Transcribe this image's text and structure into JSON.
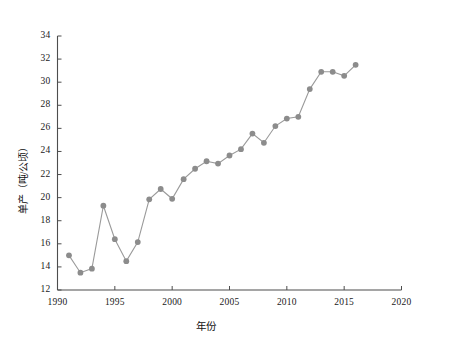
{
  "chart_data": {
    "type": "line",
    "title": "",
    "subtitle": "",
    "xlabel": "年份",
    "ylabel": "单产（吨/公顷）",
    "xlim": [
      1990,
      2020
    ],
    "ylim": [
      12,
      34
    ],
    "xticks": [
      1990,
      1995,
      2000,
      2005,
      2010,
      2015,
      2020
    ],
    "yticks": [
      12,
      14,
      16,
      18,
      20,
      22,
      24,
      26,
      28,
      30,
      32,
      34
    ],
    "xtick_labels": [
      "1990",
      "1995",
      "2000",
      "2005",
      "2010",
      "2015",
      "2020"
    ],
    "ytick_labels": [
      "12",
      "14",
      "16",
      "18",
      "20",
      "22",
      "24",
      "26",
      "28",
      "30",
      "32",
      "34"
    ],
    "grid": false,
    "legend": null,
    "legend_position": "none",
    "marker": "circle",
    "marker_color": "#8c8c8c",
    "line_color": "#9a9a9a",
    "axis_color": "#4d4d4d",
    "x": [
      1991,
      1992,
      1993,
      1994,
      1995,
      1996,
      1997,
      1998,
      1999,
      2000,
      2001,
      2002,
      2003,
      2004,
      2005,
      2006,
      2007,
      2008,
      2009,
      2010,
      2011,
      2012,
      2013,
      2014,
      2015,
      2016
    ],
    "values": [
      15.0,
      13.5,
      13.85,
      19.3,
      16.4,
      14.5,
      16.15,
      19.85,
      20.75,
      19.9,
      21.6,
      22.5,
      23.15,
      22.95,
      23.65,
      24.2,
      25.55,
      24.75,
      26.2,
      26.85,
      27.0,
      29.4,
      30.9,
      30.9,
      30.55,
      31.5
    ],
    "series": [
      {
        "name": "单产",
        "x": [
          1991,
          1992,
          1993,
          1994,
          1995,
          1996,
          1997,
          1998,
          1999,
          2000,
          2001,
          2002,
          2003,
          2004,
          2005,
          2006,
          2007,
          2008,
          2009,
          2010,
          2011,
          2012,
          2013,
          2014,
          2015,
          2016
        ],
        "values": [
          15.0,
          13.5,
          13.85,
          19.3,
          16.4,
          14.5,
          16.15,
          19.85,
          20.75,
          19.9,
          21.6,
          22.5,
          23.15,
          22.95,
          23.65,
          24.2,
          25.55,
          24.75,
          26.2,
          26.85,
          27.0,
          29.4,
          30.9,
          30.9,
          30.55,
          31.5
        ]
      }
    ]
  },
  "figure": {
    "background_color": "#ffffff",
    "axis_color": "#4d4d4d",
    "accent_color": "#8c8c8c"
  }
}
